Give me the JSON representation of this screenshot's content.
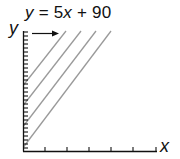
{
  "equation": {
    "y_var": "y",
    "equals": " = 5",
    "x_var": "x",
    "rest": " + 90"
  },
  "axes": {
    "x_label": "x",
    "y_label": "y"
  },
  "colors": {
    "axis": "#111111",
    "lines": "#9a9a9a",
    "text": "#111111"
  },
  "diagram": {
    "parallel_line_count": 4,
    "y_axis_tick_count": 30,
    "x_axis_tick_count": 5
  }
}
